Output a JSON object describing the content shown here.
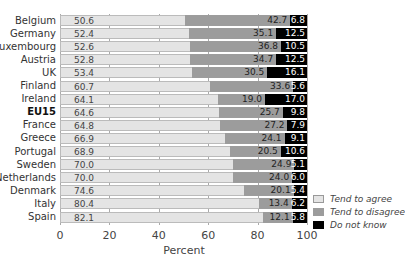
{
  "chart_data": {
    "type": "bar",
    "orientation": "horizontal",
    "stacked": true,
    "title": "",
    "xlabel": "Percent",
    "ylabel": "",
    "xlim": [
      0,
      100
    ],
    "xticks": [
      0,
      20,
      40,
      60,
      80,
      100
    ],
    "grid": true,
    "legend_position": "right-bottom",
    "categories": [
      "Belgium",
      "Germany",
      "Luxembourg",
      "Austria",
      "UK",
      "Finland",
      "Ireland",
      "EU15",
      "France",
      "Greece",
      "Portugal",
      "Sweden",
      "Netherlands",
      "Denmark",
      "Italy",
      "Spain"
    ],
    "highlight_category": "EU15",
    "series": [
      {
        "name": "Tend to agree",
        "color": "#e4e4e4",
        "values": [
          50.6,
          52.4,
          52.6,
          52.8,
          53.4,
          60.7,
          64.1,
          64.6,
          64.8,
          66.9,
          68.9,
          70.0,
          70.0,
          74.6,
          80.4,
          82.1
        ]
      },
      {
        "name": "Tend to disagree",
        "color": "#9c9c9c",
        "values": [
          42.7,
          35.1,
          36.8,
          34.7,
          30.5,
          33.6,
          19.0,
          25.7,
          27.2,
          24.1,
          20.5,
          24.9,
          24.0,
          20.1,
          13.4,
          12.1
        ]
      },
      {
        "name": "Do not know",
        "color": "#000000",
        "values": [
          6.8,
          12.5,
          10.5,
          12.5,
          16.1,
          5.6,
          17.0,
          9.8,
          7.9,
          9.1,
          10.6,
          5.1,
          6.0,
          5.4,
          6.2,
          5.8
        ]
      }
    ]
  },
  "footer_text": "Total. . . . . . . . . . (2002) . . . . . . ."
}
